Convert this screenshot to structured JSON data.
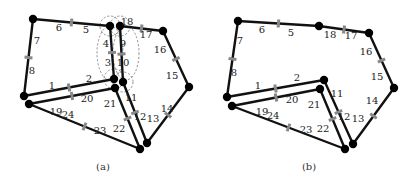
{
  "figure": {
    "panels": [
      {
        "id": "a",
        "caption": "(a)",
        "caption_pos": [
          103,
          170
        ],
        "nodes": {
          "A": [
            33,
            19
          ],
          "B": [
            110,
            26
          ],
          "C": [
            120,
            26
          ],
          "D": [
            163,
            31
          ],
          "E": [
            189,
            87
          ],
          "F": [
            147,
            143
          ],
          "G": [
            140,
            149
          ],
          "H": [
            114,
            79
          ],
          "I": [
            123,
            82
          ],
          "J": [
            115,
            88
          ],
          "K": [
            24,
            96
          ],
          "L": [
            29,
            104
          ]
        },
        "edges": [
          {
            "from": "A",
            "to": "B",
            "labels": [
              "6",
              "5"
            ],
            "label_pos": [
              [
                59,
                31
              ],
              [
                86,
                33
              ]
            ]
          },
          {
            "from": "A",
            "to": "K",
            "labels": [
              "7",
              "8"
            ],
            "label_pos": [
              [
                37,
                44
              ],
              [
                32,
                74
              ]
            ]
          },
          {
            "from": "B",
            "to": "H",
            "labels": [
              "4",
              "3"
            ],
            "label_pos": [
              [
                106,
                47
              ],
              [
                108,
                66
              ]
            ]
          },
          {
            "from": "C",
            "to": "I",
            "labels": [
              "9",
              "10"
            ],
            "label_pos": [
              [
                123,
                47
              ],
              [
                123,
                66
              ]
            ]
          },
          {
            "from": "C",
            "to": "D",
            "labels": [
              "18",
              "17"
            ],
            "label_pos": [
              [
                127,
                25
              ],
              [
                146,
                38
              ]
            ]
          },
          {
            "from": "D",
            "to": "E",
            "labels": [
              "16",
              "15"
            ],
            "label_pos": [
              [
                160,
                53
              ],
              [
                172,
                79
              ]
            ]
          },
          {
            "from": "E",
            "to": "F",
            "labels": [
              "14",
              "13"
            ],
            "label_pos": [
              [
                167,
                112
              ],
              [
                153,
                122
              ]
            ]
          },
          {
            "from": "I",
            "to": "F",
            "labels": [
              "11",
              "12"
            ],
            "label_pos": [
              [
                131,
                101
              ],
              [
                140,
                120
              ]
            ]
          },
          {
            "from": "J",
            "to": "G",
            "labels": [
              "21",
              "22"
            ],
            "label_pos": [
              [
                110,
                107
              ],
              [
                119,
                132
              ]
            ]
          },
          {
            "from": "H",
            "to": "K",
            "labels": [
              "2",
              "1"
            ],
            "label_pos": [
              [
                89,
                82
              ],
              [
                52,
                89
              ]
            ]
          },
          {
            "from": "J",
            "to": "L",
            "labels": [
              "20",
              "19"
            ],
            "label_pos": [
              [
                87,
                102
              ],
              [
                56,
                115
              ]
            ]
          },
          {
            "from": "L",
            "to": "G",
            "labels": [
              "24",
              "23"
            ],
            "label_pos": [
              [
                68,
                118
              ],
              [
                100,
                134
              ]
            ]
          }
        ],
        "annotations": {
          "dashed_ellipses": [
            {
              "cx": 110,
              "cy": 53,
              "rx": 13,
              "ry": 27
            },
            {
              "cx": 126,
              "cy": 53,
              "rx": 13,
              "ry": 27
            }
          ],
          "dashed_arcs": [
            {
              "cx": 110,
              "cy": 26,
              "r": 10
            },
            {
              "cx": 120,
              "cy": 26,
              "r": 10
            },
            {
              "cx": 114,
              "cy": 79,
              "r": 10
            },
            {
              "cx": 123,
              "cy": 82,
              "r": 10
            }
          ]
        }
      },
      {
        "id": "b",
        "caption": "(b)",
        "caption_pos": [
          309,
          170
        ],
        "nodes": {
          "A": [
            238,
            21
          ],
          "M": [
            319,
            26
          ],
          "D": [
            369,
            33
          ],
          "E": [
            394,
            88
          ],
          "F": [
            353,
            144
          ],
          "G": [
            345,
            149
          ],
          "H": [
            324,
            80
          ],
          "J": [
            320,
            89
          ],
          "K": [
            227,
            97
          ],
          "L": [
            232,
            106
          ]
        },
        "edges": [
          {
            "from": "A",
            "to": "M",
            "labels": [
              "6",
              "5"
            ],
            "label_pos": [
              [
                262,
                33
              ],
              [
                291,
                36
              ]
            ]
          },
          {
            "from": "A",
            "to": "K",
            "labels": [
              "7",
              "8"
            ],
            "label_pos": [
              [
                240,
                44
              ],
              [
                234,
                76
              ]
            ]
          },
          {
            "from": "M",
            "to": "D",
            "labels": [
              "18",
              "17"
            ],
            "label_pos": [
              [
                330,
                38
              ],
              [
                351,
                39
              ]
            ]
          },
          {
            "from": "D",
            "to": "E",
            "labels": [
              "16",
              "15"
            ],
            "label_pos": [
              [
                366,
                55
              ],
              [
                377,
                80
              ]
            ]
          },
          {
            "from": "E",
            "to": "F",
            "labels": [
              "14",
              "13"
            ],
            "label_pos": [
              [
                372,
                104
              ],
              [
                358,
                122
              ]
            ]
          },
          {
            "from": "H",
            "to": "F",
            "labels": [
              "11",
              "12"
            ],
            "label_pos": [
              [
                337,
                97
              ],
              [
                344,
                120
              ]
            ]
          },
          {
            "from": "J",
            "to": "G",
            "labels": [
              "21",
              "22"
            ],
            "label_pos": [
              [
                314,
                108
              ],
              [
                323,
                132
              ]
            ]
          },
          {
            "from": "H",
            "to": "K",
            "labels": [
              "2",
              "1"
            ],
            "label_pos": [
              [
                297,
                81
              ],
              [
                258,
                89
              ]
            ]
          },
          {
            "from": "J",
            "to": "L",
            "labels": [
              "20",
              "19"
            ],
            "label_pos": [
              [
                292,
                103
              ],
              [
                262,
                115
              ]
            ]
          },
          {
            "from": "L",
            "to": "G",
            "labels": [
              "24",
              "23"
            ],
            "label_pos": [
              [
                273,
                119
              ],
              [
                306,
                133
              ]
            ]
          }
        ]
      }
    ]
  }
}
